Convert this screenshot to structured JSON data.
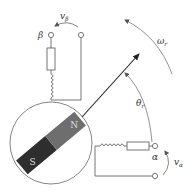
{
  "diagram": {
    "labels": {
      "beta": "β",
      "alpha": "α",
      "v_beta": "vβ",
      "v_alpha": "vα",
      "omega_r": "ωr",
      "theta_r": "θr",
      "north": "N",
      "south": "S"
    },
    "label_parts": {
      "v": "v",
      "beta_sub": "β",
      "alpha_sub": "α",
      "omega": "ω",
      "theta": "θ",
      "r_sub": "r"
    },
    "colors": {
      "line": "#555555",
      "arrow": "#222222",
      "magnet_north": "#6e6e6e",
      "magnet_south": "#2e2e2e",
      "magnet_text": "#dddddd",
      "arc": "#777777"
    }
  }
}
